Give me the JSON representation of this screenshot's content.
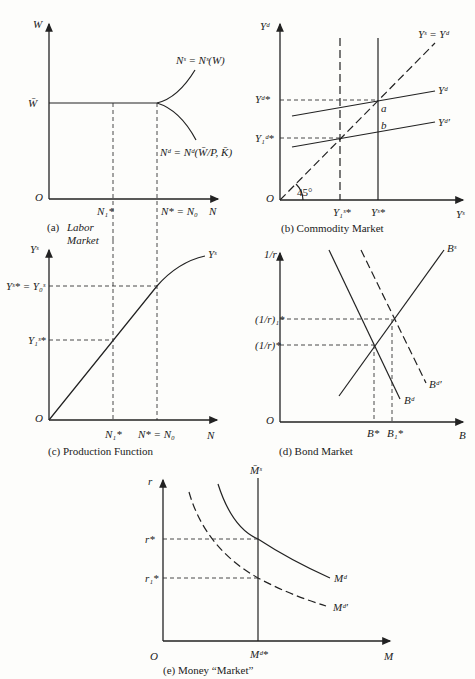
{
  "panels": {
    "a": {
      "caption_letter": "(a)",
      "caption_line1": "Labor",
      "caption_line2": "Market",
      "y_axis": "W",
      "x_axis": "N",
      "origin": "O",
      "wage_level": "W̄",
      "supply_label": "Nˢ = Nˢ(W)",
      "demand_label": "Nᵈ = Nᵈ(W̄/P, K̄)",
      "x_tick_1": "N₁*",
      "x_tick_2": "N* = N₀"
    },
    "b": {
      "caption": "(b) Commodity Market",
      "y_axis": "Yᵈ",
      "x_axis": "Yˢ",
      "origin": "O",
      "line_45": "Yˢ = Yᵈ",
      "angle_label": "45°",
      "demand_label": "Yᵈ",
      "demand2_label": "Yᵈ′",
      "point_a": "a",
      "point_b": "b",
      "y_tick_1": "Yᵈ*",
      "y_tick_2": "Y₁ᵈ*",
      "x_tick_1": "Y₁ˢ*",
      "x_tick_2": "Yˢ*"
    },
    "c": {
      "caption": "(c) Production Function",
      "y_axis": "Yˢ",
      "x_axis": "N",
      "origin": "O",
      "curve_label": "Yˢ",
      "y_tick_1": "Yˢ* = Y₀ˢ",
      "y_tick_2": "Y₁ˢ*",
      "x_tick_1": "N₁*",
      "x_tick_2": "N* = N₀"
    },
    "d": {
      "caption": "(d) Bond Market",
      "y_axis": "1/r",
      "x_axis": "B",
      "origin": "O",
      "supply_label": "Bˢ",
      "demand_label": "Bᵈ",
      "demand2_label": "Bᵈ′",
      "y_tick_1": "(1/r)₁*",
      "y_tick_2": "(1/r)*",
      "x_tick_1": "B*",
      "x_tick_2": "B₁*"
    },
    "e": {
      "caption": "(e) Money “Market”",
      "y_axis": "r",
      "x_axis": "M",
      "origin": "O",
      "supply_label": "M̄ˢ",
      "demand_label": "Mᵈ",
      "demand2_label": "Mᵈ′",
      "y_tick_1": "r*",
      "y_tick_2": "r₁*",
      "x_tick": "Mᵈ*"
    }
  }
}
